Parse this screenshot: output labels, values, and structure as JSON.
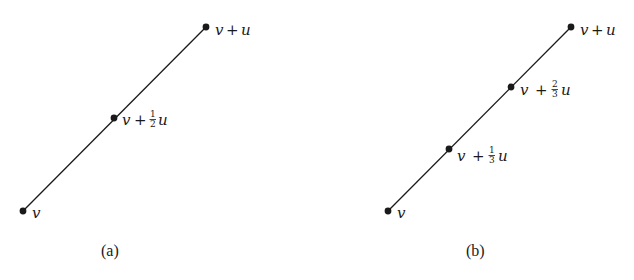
{
  "figure": {
    "panels": [
      {
        "id": "a",
        "caption": "(a)",
        "points": [
          {
            "label_base": "v",
            "label_op": "",
            "label_num": "",
            "label_den": "",
            "label_tail": ""
          },
          {
            "label_base": "v",
            "label_op": "+",
            "label_num": "1",
            "label_den": "2",
            "label_tail": "u"
          },
          {
            "label_base": "v",
            "label_op": "+",
            "label_num": "",
            "label_den": "",
            "label_tail": "u"
          }
        ]
      },
      {
        "id": "b",
        "caption": "(b)",
        "points": [
          {
            "label_base": "v",
            "label_op": "",
            "label_num": "",
            "label_den": "",
            "label_tail": ""
          },
          {
            "label_base": "v",
            "label_op": "+",
            "label_num": "1",
            "label_den": "3",
            "label_tail": "u"
          },
          {
            "label_base": "v",
            "label_op": "+",
            "label_num": "2",
            "label_den": "3",
            "label_tail": "u"
          },
          {
            "label_base": "v",
            "label_op": "+",
            "label_num": "",
            "label_den": "",
            "label_tail": "u"
          }
        ]
      }
    ],
    "colors": {
      "ink": "#1a1a1a",
      "background": "#ffffff"
    }
  }
}
